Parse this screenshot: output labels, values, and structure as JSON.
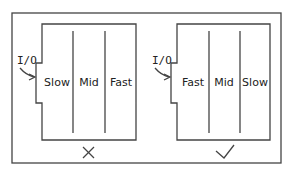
{
  "diagram": {
    "left_panel": {
      "port_label": "I/O",
      "zones": [
        "Slow",
        "Mid",
        "Fast"
      ],
      "verdict_symbol": "✕",
      "verdict": "incorrect"
    },
    "right_panel": {
      "port_label": "I/O",
      "zones": [
        "Fast",
        "Mid",
        "Slow"
      ],
      "verdict_symbol": "✓",
      "verdict": "correct"
    },
    "colors": {
      "line": "#444444",
      "text": "#222222",
      "background": "#ffffff"
    }
  }
}
